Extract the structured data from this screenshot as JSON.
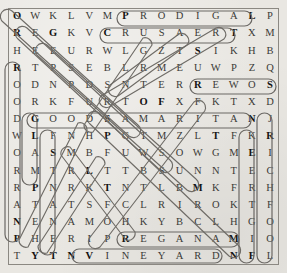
{
  "puzzle": {
    "type": "word-search",
    "rows": 15,
    "columns": 15,
    "grid": [
      [
        "O",
        "W",
        "K",
        "L",
        "V",
        "M",
        "P",
        "R",
        "O",
        "D",
        "I",
        "G",
        "A",
        "L",
        "P"
      ],
      [
        "R",
        "E",
        "G",
        "K",
        "V",
        "C",
        "R",
        "U",
        "S",
        "A",
        "E",
        "R",
        "T",
        "X",
        "M"
      ],
      [
        "H",
        "E",
        "E",
        "U",
        "R",
        "W",
        "L",
        "G",
        "Z",
        "T",
        "S",
        "I",
        "K",
        "H",
        "B"
      ],
      [
        "R",
        "T",
        "P",
        "S",
        "E",
        "B",
        "L",
        "R",
        "M",
        "E",
        "U",
        "W",
        "P",
        "Z",
        "Q"
      ],
      [
        "O",
        "D",
        "N",
        "P",
        "D",
        "S",
        "N",
        "T",
        "E",
        "R",
        "R",
        "E",
        "W",
        "O",
        "S"
      ],
      [
        "O",
        "R",
        "K",
        "F",
        "U",
        "R",
        "T",
        "O",
        "F",
        "X",
        "F",
        "K",
        "T",
        "X",
        "D"
      ],
      [
        "D",
        "G",
        "O",
        "O",
        "D",
        "S",
        "A",
        "M",
        "A",
        "R",
        "I",
        "T",
        "A",
        "N",
        "J"
      ],
      [
        "W",
        "L",
        "F",
        "N",
        "H",
        "P",
        "G",
        "T",
        "M",
        "Z",
        "L",
        "T",
        "F",
        "K",
        "R"
      ],
      [
        "O",
        "A",
        "S",
        "M",
        "B",
        "F",
        "U",
        "W",
        "S",
        "O",
        "W",
        "G",
        "M",
        "E",
        "I"
      ],
      [
        "R",
        "M",
        "T",
        "R",
        "L",
        "T",
        "T",
        "B",
        "S",
        "U",
        "N",
        "N",
        "T",
        "E",
        "C"
      ],
      [
        "R",
        "P",
        "N",
        "R",
        "K",
        "T",
        "N",
        "T",
        "L",
        "B",
        "M",
        "K",
        "F",
        "R",
        "H"
      ],
      [
        "A",
        "T",
        "A",
        "T",
        "S",
        "F",
        "C",
        "L",
        "R",
        "I",
        "R",
        "O",
        "K",
        "T",
        "F"
      ],
      [
        "N",
        "E",
        "N",
        "A",
        "M",
        "O",
        "H",
        "K",
        "Y",
        "B",
        "C",
        "L",
        "H",
        "G",
        "O"
      ],
      [
        "P",
        "H",
        "E",
        "R",
        "I",
        "P",
        "R",
        "E",
        "G",
        "A",
        "N",
        "A",
        "M",
        "I",
        "O"
      ],
      [
        "T",
        "Y",
        "T",
        "N",
        "V",
        "I",
        "N",
        "E",
        "Y",
        "A",
        "R",
        "D",
        "N",
        "F",
        "L"
      ]
    ],
    "found_words": [
      {
        "text": "PRODIGAL",
        "start": [
          0,
          6
        ],
        "end": [
          0,
          13
        ],
        "direction": "horizontal"
      },
      {
        "text": "CRUSAERT",
        "start": [
          1,
          5
        ],
        "end": [
          1,
          12
        ],
        "direction": "horizontal"
      },
      {
        "text": "SOWER",
        "start": [
          4,
          10
        ],
        "end": [
          4,
          14
        ],
        "direction": "horizontal"
      },
      {
        "text": "GOOD SAMARITAN",
        "start": [
          6,
          1
        ],
        "end": [
          6,
          13
        ],
        "direction": "horizontal"
      },
      {
        "text": "MANAGER",
        "start": [
          13,
          6
        ],
        "end": [
          13,
          12
        ],
        "direction": "horizontal"
      },
      {
        "text": "VINEYARD",
        "start": [
          14,
          4
        ],
        "end": [
          14,
          12
        ],
        "direction": "horizontal"
      },
      {
        "text": "RICH FOOL",
        "start": [
          7,
          14
        ],
        "end": [
          14,
          14
        ],
        "direction": "vertical"
      },
      {
        "text": "LAMP",
        "start": [
          7,
          1
        ],
        "end": [
          10,
          1
        ],
        "direction": "vertical"
      },
      {
        "text": "STN",
        "start": [
          8,
          2
        ],
        "end": [
          10,
          2
        ],
        "direction": "vertical"
      },
      {
        "text": "ROODW",
        "start": [
          3,
          0
        ],
        "end": [
          14,
          0
        ],
        "direction": "vertical"
      },
      {
        "text": "EERTGIF",
        "start": [
          8,
          13
        ],
        "end": [
          14,
          13
        ],
        "direction": "vertical"
      },
      {
        "text": "OREG",
        "start": [
          0,
          0
        ],
        "end": [
          2,
          2
        ],
        "direction": "diagonal-down-right"
      },
      {
        "text": "DIAGONAL-A",
        "start": [
          0,
          0
        ],
        "end": [
          7,
          7
        ],
        "direction": "diagonal-down-right"
      },
      {
        "text": "DIAGONAL-B",
        "start": [
          1,
          1
        ],
        "end": [
          9,
          9
        ],
        "direction": "diagonal-down-right"
      },
      {
        "text": "DIAGONAL-C",
        "start": [
          5,
          7
        ],
        "end": [
          1,
          12
        ],
        "direction": "diagonal-up-right"
      },
      {
        "text": "DIAGONAL-D",
        "start": [
          2,
          10
        ],
        "end": [
          5,
          8
        ],
        "direction": "diagonal-up-right"
      },
      {
        "text": "DIAGONAL-E",
        "start": [
          7,
          5
        ],
        "end": [
          14,
          12
        ],
        "direction": "diagonal-down-right"
      },
      {
        "text": "DIAGONAL-F",
        "start": [
          7,
          11
        ],
        "end": [
          13,
          5
        ],
        "direction": "diagonal-down-left"
      },
      {
        "text": "DIAGONAL-G",
        "start": [
          9,
          3
        ],
        "end": [
          14,
          1
        ],
        "direction": "diagonal-down-left"
      },
      {
        "text": "DIAGONAL-H",
        "start": [
          10,
          5
        ],
        "end": [
          14,
          2
        ],
        "direction": "diagonal-down-left"
      }
    ],
    "highlighted_cells": [
      [
        0,
        0
      ],
      [
        0,
        6
      ],
      [
        0,
        13
      ],
      [
        1,
        0
      ],
      [
        1,
        2
      ],
      [
        1,
        5
      ],
      [
        1,
        12
      ],
      [
        2,
        10
      ],
      [
        3,
        0
      ],
      [
        4,
        10
      ],
      [
        4,
        14
      ],
      [
        5,
        7
      ],
      [
        5,
        8
      ],
      [
        6,
        1
      ],
      [
        6,
        5
      ],
      [
        6,
        13
      ],
      [
        7,
        1
      ],
      [
        7,
        5
      ],
      [
        7,
        11
      ],
      [
        7,
        14
      ],
      [
        8,
        2
      ],
      [
        8,
        13
      ],
      [
        9,
        4
      ],
      [
        10,
        1
      ],
      [
        10,
        5
      ],
      [
        10,
        10
      ],
      [
        12,
        0
      ],
      [
        13,
        0
      ],
      [
        13,
        6
      ],
      [
        13,
        12
      ],
      [
        14,
        1
      ],
      [
        14,
        2
      ],
      [
        14,
        3
      ],
      [
        14,
        4
      ],
      [
        14,
        12
      ],
      [
        14,
        13
      ]
    ],
    "colors": {
      "paper": "#e9e7e2",
      "letter": "#3b3a37",
      "letter_highlighted": "#141312",
      "marker": "#6f6c67",
      "border": "#8b8882"
    }
  }
}
